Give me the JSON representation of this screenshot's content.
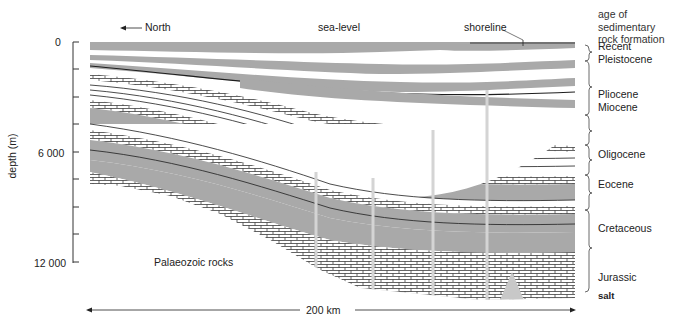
{
  "diagram": {
    "type": "geological-cross-section",
    "labels": {
      "north": "North",
      "sea_level": "sea-level",
      "shoreline": "shoreline",
      "palaeozoic": "Palaeozoic rocks",
      "salt": "salt",
      "distance": "200 km"
    },
    "depth_axis": {
      "title": "depth (m)",
      "ticks": [
        {
          "value": 0,
          "label": "0"
        },
        {
          "value": 6000,
          "label": "6 000"
        },
        {
          "value": 12000,
          "label": "12 000"
        }
      ],
      "minor_tick_interval_m": 1500,
      "range_m": [
        0,
        12000
      ]
    },
    "age_legend": {
      "title_line1": "age of sedimentary",
      "title_line2": "rock formation",
      "periods": [
        {
          "label": "Recent",
          "label2": "Pleistocene"
        },
        {
          "label": "Pliocene",
          "label2": "Miocene"
        },
        {
          "label": "Oligocene"
        },
        {
          "label": "Eocene"
        },
        {
          "label": "Cretaceous"
        },
        {
          "label": "Jurassic"
        }
      ]
    },
    "colors": {
      "shale_grey": "#a9a9a9",
      "sand_white": "#ffffff",
      "line_dark": "#1e1e1e",
      "fault_light": "#d4d4d4",
      "salt_grey": "#c8c8c8"
    }
  }
}
